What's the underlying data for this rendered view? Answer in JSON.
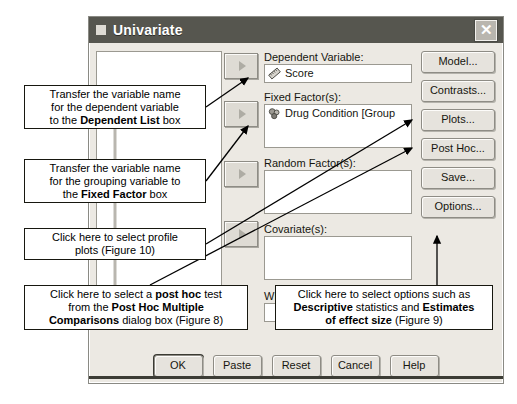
{
  "window": {
    "title": "Univariate",
    "close_label": "✕",
    "close_icon": "close-icon"
  },
  "fields": {
    "dependent": {
      "label": "Dependent Variable:",
      "value": "Score",
      "icon": "scale-measure-icon"
    },
    "fixed_factors": {
      "label": "Fixed Factor(s):",
      "value": "Drug Condition [Group",
      "icon": "nominal-measure-icon"
    },
    "random_factors": {
      "label": "Random Factor(s):",
      "value": ""
    },
    "covariates": {
      "label": "Covariate(s):",
      "value": ""
    },
    "wls_weight": {
      "label": "WL",
      "value": ""
    }
  },
  "transfer_buttons": [
    {
      "name": "transfer-to-dependent",
      "glyph": "▶"
    },
    {
      "name": "transfer-to-fixed-factors",
      "glyph": "▶"
    },
    {
      "name": "transfer-to-random-factors",
      "glyph": "▶"
    },
    {
      "name": "transfer-to-covariates",
      "glyph": "▶"
    }
  ],
  "side_buttons": [
    {
      "label": "Model..."
    },
    {
      "label": "Contrasts..."
    },
    {
      "label": "Plots..."
    },
    {
      "label": "Post Hoc..."
    },
    {
      "label": "Save..."
    },
    {
      "label": "Options..."
    }
  ],
  "bottom_buttons": [
    {
      "label": "OK"
    },
    {
      "label": "Paste"
    },
    {
      "label": "Reset"
    },
    {
      "label": "Cancel"
    },
    {
      "label": "Help"
    }
  ],
  "callouts": {
    "dependent_note": {
      "line1": "Transfer the variable name",
      "line2": "for the dependent variable",
      "line3_pre": "to the ",
      "line3_bold": "Dependent List",
      "line3_post": " box"
    },
    "fixed_factor_note": {
      "line1": "Transfer the variable name",
      "line2": "for the grouping variable to",
      "line3_pre": "the ",
      "line3_bold": "Fixed Factor",
      "line3_post": " box"
    },
    "plots_note": {
      "line1": "Click here to select profile",
      "line2": "plots (Figure 10)"
    },
    "post_hoc_note": {
      "line1_pre": "Click here to select a ",
      "line1_bold": "post hoc",
      "line1_post": " test",
      "line2_pre": "from the ",
      "line2_bold": "Post Hoc Multiple",
      "line3_bold": "Comparisons",
      "line3_post": " dialog box (Figure 8)"
    },
    "options_note": {
      "line1": "Click here to select options such as",
      "line2_bold": "Descriptive",
      "line2_mid": " statistics and ",
      "line2_bold2": "Estimates",
      "line3_bold": "of effect size",
      "line3_post": " (Figure 9)"
    }
  },
  "colors": {
    "dialog_face": "#ece9e3",
    "titlebar": "#56564f",
    "field_bg": "#ffffff",
    "border": "#8e8c85",
    "annotation_border": "#17170f"
  }
}
